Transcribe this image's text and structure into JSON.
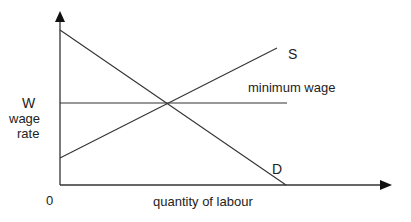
{
  "diagram": {
    "title": "",
    "type": "labour market minimum wage diagram",
    "axes": {
      "origin_label": "0",
      "x_label": "quantity of labour",
      "y_label_line1": "wage",
      "y_label_line2": "rate"
    },
    "curves": {
      "supply_label": "S",
      "demand_label": "D",
      "min_wage_label": "minimum wage",
      "min_wage_level_label": "W"
    },
    "colors": {
      "line": "#333333",
      "text": "#222222",
      "background": "#ffffff"
    }
  }
}
